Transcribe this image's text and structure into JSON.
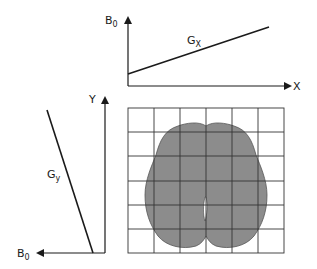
{
  "top_panel": {
    "y_axis_label": "B",
    "y_axis_label_sub": "0",
    "x_axis_label": "X",
    "line_label": "G",
    "line_label_sub": "X"
  },
  "left_panel": {
    "y_axis_label": "Y",
    "b_axis_label": "B",
    "b_axis_label_sub": "0",
    "line_label": "G",
    "line_label_sub": "y"
  },
  "grid": {
    "rows": 6,
    "cols": 6,
    "object": "brain axial slice silhouette"
  },
  "colors": {
    "ink": "#1a1a1a",
    "brain_fill": "#8c8c8c",
    "grid_line": "#333333"
  }
}
